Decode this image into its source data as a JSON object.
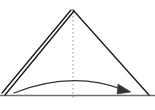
{
  "figure": {
    "kind": "origami-fold-diagram",
    "background_color": "#ffffff",
    "width": 155,
    "height": 110
  },
  "colors": {
    "ink": "#2b2b2b",
    "edge_dark": "#1a1a1a",
    "baseline_gray": "#6e6e6e",
    "crease_dotted": "#9a9a9a",
    "arrow": "#333333"
  },
  "geometry": {
    "apex": {
      "x": 73,
      "y": 10
    },
    "bottom_left": {
      "x": 2,
      "y": 95
    },
    "bottom_right": {
      "x": 149,
      "y": 95
    },
    "baseline_y": 95
  },
  "shapes": {
    "triangle": {
      "label": "folded paper triangle",
      "points": "73,10 149,95 2,95"
    },
    "left_edge_outer": {
      "label": "left edge outer layer",
      "x1": 71,
      "y1": 10,
      "x2": 2,
      "y2": 93
    },
    "left_edge_inner": {
      "label": "left edge inner layer",
      "x1": 74,
      "y1": 11,
      "x2": 5,
      "y2": 95
    },
    "right_edge": {
      "label": "right edge",
      "x1": 73,
      "y1": 10,
      "x2": 149,
      "y2": 95
    },
    "baseline": {
      "label": "bottom edge",
      "x1": 0,
      "y1": 95.5,
      "x2": 155,
      "y2": 95.5
    },
    "crease": {
      "label": "vertical centre crease",
      "x1": 73,
      "y1": 12,
      "x2": 73,
      "y2": 99,
      "dash": "1.4 2.6"
    },
    "fold_arrow": {
      "label": "fold direction arrow",
      "path": "M 14 93 Q 72 70 124 90",
      "head": "118,84 131,92 117,94"
    }
  },
  "annotations": {
    "crease_meaning": "valley/mountain reference line",
    "arrow_meaning": "fold left flap over to the right"
  }
}
